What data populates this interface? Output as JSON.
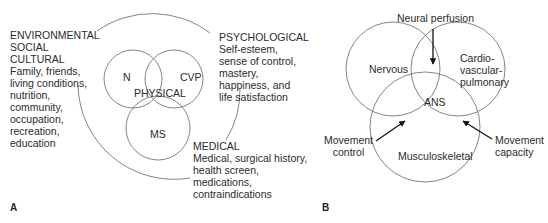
{
  "panel_a": {
    "label": "A",
    "categories": {
      "environmental": {
        "heading_lines": [
          "ENVIRONMENTAL",
          "SOCIAL",
          "CULTURAL"
        ],
        "detail_lines": [
          "Family, friends,",
          "living conditions,",
          "nutrition,",
          "community,",
          "occupation,",
          "recreation,",
          "education"
        ]
      },
      "psychological": {
        "heading_lines": [
          "PSYCHOLOGICAL"
        ],
        "detail_lines": [
          "Self-esteem,",
          "sense of control,",
          "mastery,",
          "happiness, and",
          "life satisfaction"
        ]
      },
      "medical": {
        "heading_lines": [
          "MEDICAL"
        ],
        "detail_lines": [
          "Medical, surgical history,",
          "health screen,",
          "medications,",
          "contraindications"
        ]
      }
    },
    "circles": {
      "n": "N",
      "cvp": "CVP",
      "ms": "MS",
      "center": "PHYSICAL"
    }
  },
  "panel_b": {
    "label": "B",
    "circles": {
      "nervous": "Nervous",
      "cvp_lines": [
        "Cardio-",
        "vascular-",
        "pulmonary"
      ],
      "msk": "Musculoskeletal",
      "center": "ANS"
    },
    "arrows": {
      "neural_perfusion": "Neural perfusion",
      "movement_control_lines": [
        "Movement",
        "control"
      ],
      "movement_capacity_lines": [
        "Movement",
        "capacity"
      ]
    }
  }
}
